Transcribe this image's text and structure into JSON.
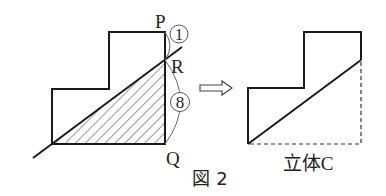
{
  "figure": {
    "caption": "図 2",
    "left": {
      "points": {
        "P": "P",
        "R": "R",
        "Q": "Q"
      },
      "ratio_top": "1",
      "ratio_bottom": "8"
    },
    "right": {
      "label": "立体C"
    },
    "colors": {
      "line": "#1a1a1a",
      "hatch": "#333333",
      "arc": "#666666"
    }
  }
}
